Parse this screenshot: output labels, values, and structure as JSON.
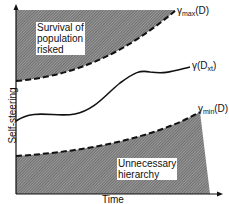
{
  "axes": {
    "x_label": "Time",
    "y_label": "Self-steering"
  },
  "regions": {
    "top": "Survival of population risked",
    "top_lines": [
      "Survival of",
      "population",
      "risked"
    ],
    "bottom": "Unnecessary hierarchy",
    "bottom_lines": [
      "Unnecessary",
      "hierarchy"
    ]
  },
  "curves": {
    "max": {
      "prefix": "γ",
      "sub": "max",
      "suffix": "(D)"
    },
    "actual": {
      "prefix": "γ(D",
      "sub": "xt",
      "suffix": ")"
    },
    "min": {
      "prefix": "γ",
      "sub": "min",
      "suffix": "(D)"
    }
  },
  "colors": {
    "hatch": "#555555",
    "line": "#111111",
    "background": "#ffffff"
  }
}
